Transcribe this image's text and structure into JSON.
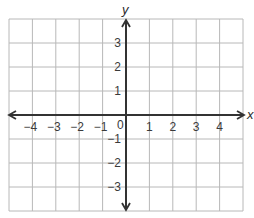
{
  "chart_data": {
    "type": "coordinate-plane",
    "title": "",
    "xlabel": "x",
    "ylabel": "y",
    "xlim": [
      -5,
      5
    ],
    "ylim": [
      -4,
      4
    ],
    "grid": true,
    "grid_step": 1,
    "x_ticks": [
      -4,
      -3,
      -2,
      -1,
      1,
      2,
      3,
      4
    ],
    "x_tick_labels": [
      "−4",
      "−3",
      "−2",
      "−1",
      "1",
      "2",
      "3",
      "4"
    ],
    "y_ticks": [
      3,
      2,
      1,
      -1,
      -2,
      -3
    ],
    "y_tick_labels": [
      "3",
      "2",
      "1",
      "−1",
      "−2",
      "−3"
    ],
    "origin_label": "0",
    "arrows": [
      "x-both",
      "y-both"
    ],
    "data_points": []
  },
  "colors": {
    "grid": "#b8b8b8",
    "axis": "#333333",
    "text": "#3a3a3a",
    "background": "#ffffff"
  }
}
